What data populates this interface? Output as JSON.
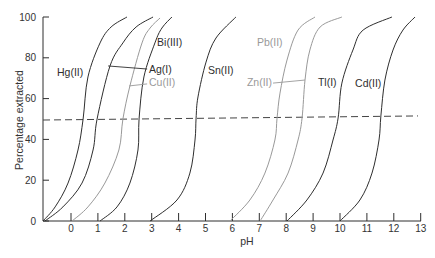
{
  "chart_data": {
    "type": "line",
    "title": "",
    "xlabel": "pH",
    "ylabel": "Percentage extracted",
    "xlim": [
      -1.04,
      13
    ],
    "ylim": [
      0,
      100
    ],
    "grid": false,
    "legend": "none (direct labels on curves)",
    "xticks": [
      0,
      1,
      2,
      3,
      4,
      5,
      6,
      7,
      8,
      9,
      10,
      11,
      12,
      13
    ],
    "yticks": [
      0,
      20,
      40,
      60,
      80,
      100
    ],
    "colors": {
      "black": "#2e2e2e",
      "gray": "#999999"
    },
    "series": [
      {
        "name": "Hg(II)",
        "color": "#2e2e2e",
        "label_color": "#2e2e2e",
        "label_pos": [
          -0.52,
          71.1
        ],
        "points": [
          [
            -1.04,
            0
          ],
          [
            -0.59,
            6.9
          ],
          [
            -0.11,
            18.6
          ],
          [
            0.26,
            34.8
          ],
          [
            0.45,
            50.0
          ],
          [
            0.63,
            70.6
          ],
          [
            1.08,
            87.3
          ],
          [
            1.49,
            95.1
          ],
          [
            2.08,
            100
          ]
        ]
      },
      {
        "name": "Ag(I)",
        "color": "#2e2e2e",
        "label_color": "#2e2e2e",
        "label_pos": [
          2.9,
          72.5
        ],
        "leader": [
          [
            1.38,
            76.0
          ],
          [
            2.83,
            74.5
          ]
        ],
        "points": [
          [
            -0.97,
            0
          ],
          [
            -0.3,
            6.9
          ],
          [
            0.41,
            18.6
          ],
          [
            0.82,
            34.8
          ],
          [
            0.97,
            50.0
          ],
          [
            1.45,
            76.0
          ],
          [
            1.93,
            87.3
          ],
          [
            2.42,
            95.1
          ],
          [
            3.05,
            100
          ]
        ]
      },
      {
        "name": "Cu(II)",
        "color": "#999999",
        "label_color": "#999999",
        "label_pos": [
          2.9,
          66.2
        ],
        "leader": [
          [
            2.16,
            66.2
          ],
          [
            2.83,
            67.2
          ]
        ],
        "points": [
          [
            0.04,
            0
          ],
          [
            0.63,
            6.9
          ],
          [
            1.26,
            18.6
          ],
          [
            1.78,
            34.8
          ],
          [
            1.93,
            50.0
          ],
          [
            2.19,
            66.2
          ],
          [
            2.64,
            87.3
          ],
          [
            2.94,
            94.6
          ],
          [
            3.31,
            99.5
          ]
        ]
      },
      {
        "name": "Bi(III)",
        "color": "#2e2e2e",
        "label_color": "#2e2e2e",
        "label_pos": [
          3.2,
          85.8
        ],
        "points": [
          [
            1.08,
            0
          ],
          [
            1.71,
            6.9
          ],
          [
            2.19,
            18.6
          ],
          [
            2.49,
            34.8
          ],
          [
            2.53,
            50.0
          ],
          [
            2.71,
            70.6
          ],
          [
            3.12,
            87.3
          ],
          [
            3.38,
            94.6
          ],
          [
            3.75,
            100
          ]
        ]
      },
      {
        "name": "Sn(II)",
        "color": "#2e2e2e",
        "label_color": "#2e2e2e",
        "label_pos": [
          5.09,
          72.1
        ],
        "points": [
          [
            2.94,
            0
          ],
          [
            3.94,
            10.3
          ],
          [
            4.42,
            23.5
          ],
          [
            4.61,
            39.7
          ],
          [
            4.65,
            50.5
          ],
          [
            4.72,
            60.8
          ],
          [
            5.02,
            77.9
          ],
          [
            5.39,
            89.7
          ],
          [
            6.13,
            100
          ]
        ]
      },
      {
        "name": "Pb(II)",
        "color": "#999999",
        "label_color": "#999999",
        "label_pos": [
          6.91,
          85.8
        ],
        "points": [
          [
            5.91,
            0
          ],
          [
            6.65,
            10.3
          ],
          [
            7.21,
            23.5
          ],
          [
            7.58,
            39.7
          ],
          [
            7.66,
            50.5
          ],
          [
            7.77,
            62.7
          ],
          [
            8.03,
            78.9
          ],
          [
            8.44,
            93.6
          ],
          [
            9.07,
            100
          ]
        ]
      },
      {
        "name": "Zn(II)",
        "color": "#999999",
        "label_color": "#999999",
        "label_pos": [
          6.54,
          66.2
        ],
        "leader": [
          [
            7.51,
            67.6
          ],
          [
            8.7,
            69.1
          ]
        ],
        "points": [
          [
            7.03,
            0
          ],
          [
            7.51,
            10.3
          ],
          [
            8.07,
            23.5
          ],
          [
            8.44,
            39.7
          ],
          [
            8.59,
            50.5
          ],
          [
            8.7,
            69.1
          ],
          [
            8.88,
            83.8
          ],
          [
            9.26,
            95.1
          ],
          [
            10.07,
            100
          ]
        ]
      },
      {
        "name": "Tl(I)",
        "color": "#2e2e2e",
        "label_color": "#2e2e2e",
        "label_pos": [
          9.18,
          66.2
        ],
        "points": [
          [
            8.03,
            0
          ],
          [
            8.77,
            10.3
          ],
          [
            9.37,
            23.5
          ],
          [
            9.74,
            39.7
          ],
          [
            9.93,
            50.5
          ],
          [
            10.07,
            67.6
          ],
          [
            10.48,
            83.8
          ],
          [
            10.86,
            93.6
          ],
          [
            11.93,
            100
          ]
        ]
      },
      {
        "name": "Cd(II)",
        "color": "#2e2e2e",
        "label_color": "#2e2e2e",
        "label_pos": [
          10.56,
          65.7
        ],
        "points": [
          [
            10.0,
            0
          ],
          [
            10.74,
            10.3
          ],
          [
            11.19,
            23.5
          ],
          [
            11.45,
            39.7
          ],
          [
            11.52,
            51.5
          ],
          [
            11.67,
            69.1
          ],
          [
            11.97,
            83.8
          ],
          [
            12.34,
            93.6
          ],
          [
            12.79,
            100
          ]
        ]
      }
    ],
    "reference_line": {
      "label": "50% extraction",
      "style": "dashed",
      "points": [
        [
          -1.04,
          49.5
        ],
        [
          12.9,
          51.5
        ]
      ]
    }
  }
}
